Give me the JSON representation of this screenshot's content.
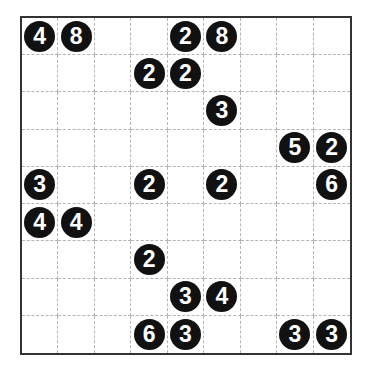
{
  "puzzle": {
    "rows": 9,
    "cols": 9,
    "colors": {
      "clue_fill": "#111111",
      "clue_text": "#ffffff",
      "grid_line": "#b5b5b5",
      "border": "#333333"
    },
    "clues": [
      {
        "r": 0,
        "c": 0,
        "v": "4"
      },
      {
        "r": 0,
        "c": 1,
        "v": "8"
      },
      {
        "r": 0,
        "c": 4,
        "v": "2"
      },
      {
        "r": 0,
        "c": 5,
        "v": "8"
      },
      {
        "r": 1,
        "c": 3,
        "v": "2"
      },
      {
        "r": 1,
        "c": 4,
        "v": "2"
      },
      {
        "r": 2,
        "c": 5,
        "v": "3"
      },
      {
        "r": 3,
        "c": 7,
        "v": "5"
      },
      {
        "r": 3,
        "c": 8,
        "v": "2"
      },
      {
        "r": 4,
        "c": 0,
        "v": "3"
      },
      {
        "r": 4,
        "c": 3,
        "v": "2"
      },
      {
        "r": 4,
        "c": 5,
        "v": "2"
      },
      {
        "r": 4,
        "c": 8,
        "v": "6"
      },
      {
        "r": 5,
        "c": 0,
        "v": "4"
      },
      {
        "r": 5,
        "c": 1,
        "v": "4"
      },
      {
        "r": 6,
        "c": 3,
        "v": "2"
      },
      {
        "r": 7,
        "c": 4,
        "v": "3"
      },
      {
        "r": 7,
        "c": 5,
        "v": "4"
      },
      {
        "r": 8,
        "c": 3,
        "v": "6"
      },
      {
        "r": 8,
        "c": 4,
        "v": "3"
      },
      {
        "r": 8,
        "c": 7,
        "v": "3"
      },
      {
        "r": 8,
        "c": 8,
        "v": "3"
      }
    ]
  }
}
